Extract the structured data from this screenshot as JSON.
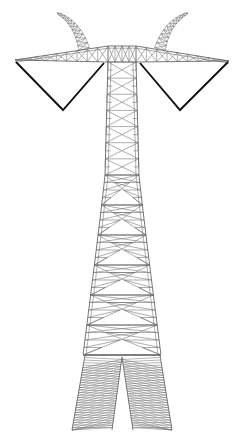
{
  "scene": {
    "title": "Electricity transmission pylon",
    "subject": "lattice steel power transmission tower",
    "view": "front elevation line drawing",
    "background_color": "#ffffff",
    "canvas": {
      "width": 244,
      "height": 436
    }
  },
  "palette": {
    "background": "#ffffff",
    "lattice_line": "#6d6d6d",
    "chord_line": "#4a4a4a",
    "conductor_line": "#111111",
    "fan_line": "#6a6a6a"
  },
  "structure": {
    "style": "line-drawing",
    "symmetry": "bilateral about vertical centre axis",
    "center_x": 122,
    "parts": [
      {
        "name": "left-earthwire-peak",
        "label": "Left ground-wire peak",
        "tip": [
          57,
          13
        ]
      },
      {
        "name": "right-earthwire-peak",
        "label": "Right ground-wire peak",
        "tip": [
          188,
          13
        ]
      },
      {
        "name": "left-crossarm",
        "label": "Left cross-arm",
        "tip": [
          15,
          60
        ]
      },
      {
        "name": "right-crossarm",
        "label": "Right cross-arm",
        "tip": [
          229,
          61
        ]
      },
      {
        "name": "left-conductor-vee",
        "label": "Left conductor suspension vee",
        "apex": [
          63,
          110
        ]
      },
      {
        "name": "right-conductor-vee",
        "label": "Right conductor suspension vee",
        "apex": [
          180,
          110
        ]
      },
      {
        "name": "mast",
        "label": "Main lattice mast",
        "top_y": 62,
        "bottom_y": 355
      },
      {
        "name": "left-leg",
        "label": "Left splayed leg",
        "foot": [
          72,
          430
        ]
      },
      {
        "name": "right-leg",
        "label": "Right splayed leg",
        "foot": [
          172,
          430
        ]
      }
    ]
  },
  "geometry": {
    "mast": {
      "top_y": 62,
      "waist_y": 175,
      "bottom_y": 355,
      "top_half_width": 14,
      "waist_half_width": 17,
      "bottom_half_width": 39,
      "upper_panel_count": 7,
      "lower_panel_count": 6
    },
    "crossarm": {
      "top_y": 46,
      "bottom_y": 62,
      "left_tip_x": 15,
      "right_tip_x": 229,
      "left_tip_y": 60,
      "right_tip_y": 61,
      "bay_count": 9
    },
    "peaks": {
      "left": {
        "base_x": 84,
        "base_y": 49,
        "tip_x": 57,
        "tip_y": 13,
        "rungs": 9
      },
      "right": {
        "base_x": 160,
        "base_y": 49,
        "tip_x": 188,
        "tip_y": 13,
        "rungs": 9
      }
    },
    "conductor_vees": {
      "left": {
        "start": [
          16,
          62
        ],
        "apex": [
          63,
          110
        ],
        "end": [
          104,
          63
        ]
      },
      "right": {
        "start": [
          140,
          63
        ],
        "apex": [
          180,
          110
        ],
        "end": [
          228,
          62
        ]
      }
    },
    "legs": {
      "split_y": 355,
      "apex_x": 122,
      "left": {
        "inner_foot": [
          112,
          430
        ],
        "outer_foot": [
          72,
          430
        ],
        "outer_top": [
          85,
          355
        ]
      },
      "right": {
        "inner_foot": [
          133,
          430
        ],
        "outer_foot": [
          172,
          430
        ],
        "outer_top": [
          160,
          355
        ]
      },
      "fan_line_count": 30
    }
  }
}
